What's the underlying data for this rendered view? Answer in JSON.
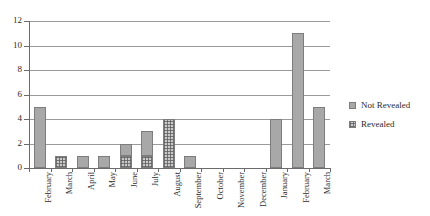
{
  "chart_data": {
    "type": "bar",
    "subtype": "stacked-bar",
    "title": "",
    "xlabel": "",
    "ylabel": "",
    "ylim": [
      0,
      12
    ],
    "ytick_values": [
      0,
      2,
      4,
      6,
      8,
      10,
      12
    ],
    "ytick_labels": [
      "0",
      "2",
      "4",
      "6",
      "8",
      "10",
      "12"
    ],
    "grid": true,
    "grid_axis": "y",
    "legend_position": "right",
    "categories": [
      "February",
      "March",
      "April",
      "May",
      "June",
      "July",
      "August",
      "September",
      "October",
      "November",
      "December",
      "January",
      "February",
      "March"
    ],
    "series": [
      {
        "name": "Revealed",
        "fill": "cross-hatch",
        "color": "#c9c9c9",
        "values": [
          0,
          1,
          0,
          0,
          1,
          1,
          4,
          0,
          0,
          0,
          0,
          0,
          0,
          0
        ]
      },
      {
        "name": "Not Revealed",
        "fill": "solid",
        "color": "#a8a8a8",
        "values": [
          5,
          0,
          1,
          1,
          1,
          2,
          0,
          1,
          0,
          0,
          0,
          4,
          11,
          5
        ]
      }
    ],
    "totals": [
      5,
      1,
      1,
      1,
      2,
      3,
      4,
      1,
      0,
      0,
      0,
      4,
      11,
      5
    ]
  },
  "legend": {
    "entries": [
      {
        "label": "Not Revealed",
        "fill": "solid"
      },
      {
        "label": "Revealed",
        "fill": "cross-hatch"
      }
    ]
  },
  "colors": {
    "solid_fill": "#a8a8a8",
    "hatch_fill": "#c9c9c9",
    "bar_border": "#7d7d7d",
    "gridline": "#9a9a9a",
    "axis": "#6b6b6b",
    "text": "#2b2b2b",
    "background": "#ffffff"
  }
}
